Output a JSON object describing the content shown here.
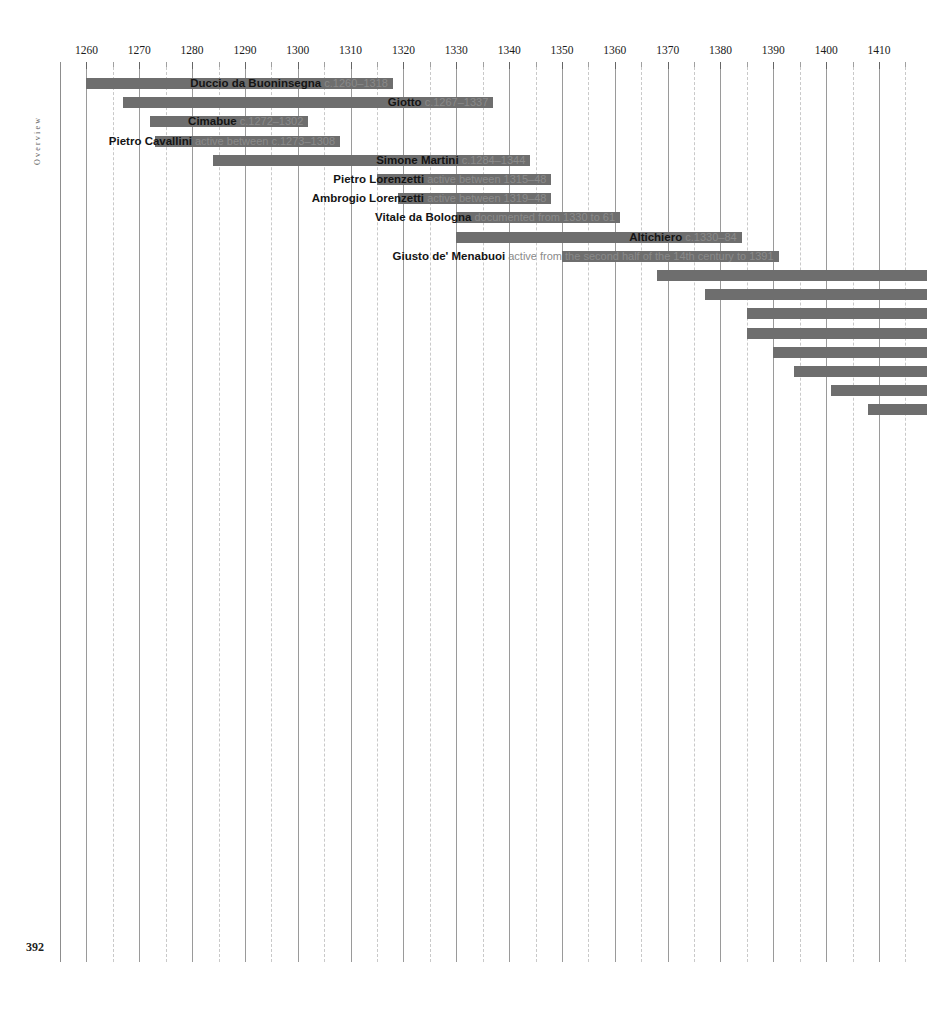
{
  "page": {
    "folio": "392",
    "section_label": "Overview"
  },
  "chart_data": {
    "type": "bar",
    "orientation": "horizontal",
    "title": "",
    "subtitle": "",
    "xlabel": "",
    "ylabel": "",
    "grid": true,
    "legend_position": "none",
    "xlim": [
      1255,
      1417
    ],
    "axis": {
      "major_step": 10,
      "minor_step": 5,
      "tick_labels": [
        "1260",
        "1270",
        "1280",
        "1290",
        "1300",
        "1310",
        "1320",
        "1330",
        "1340",
        "1350",
        "1360",
        "1370",
        "1380",
        "1390",
        "1400",
        "1410"
      ],
      "tick_values": [
        1260,
        1270,
        1280,
        1290,
        1300,
        1310,
        1320,
        1330,
        1340,
        1350,
        1360,
        1370,
        1380,
        1390,
        1400,
        1410
      ],
      "minor_tick_values": [
        1265,
        1275,
        1285,
        1295,
        1305,
        1315,
        1325,
        1335,
        1345,
        1355,
        1365,
        1375,
        1385,
        1395,
        1405,
        1415
      ]
    },
    "bar_color": "#6e6e6e",
    "categories": [
      "Duccio da Buoninsegna",
      "Giotto",
      "Cimabue",
      "Pietro Cavallini",
      "Simone Martini",
      "Pietro Lorenzetti",
      "Ambrogio Lorenzetti",
      "Vitale da Bologna",
      "Altichiero",
      "Giusto de' Menabuoi"
    ],
    "series": [
      {
        "name": "lifespan-or-activity-range",
        "values": [
          {
            "name": "Duccio da Buoninsegna",
            "dates": "c.1260–1318",
            "start": 1260,
            "end": 1318
          },
          {
            "name": "Giotto",
            "dates": "c.1267–1337",
            "start": 1267,
            "end": 1337
          },
          {
            "name": "Cimabue",
            "dates": "c.1272–1302",
            "start": 1272,
            "end": 1302
          },
          {
            "name": "Pietro Cavallini",
            "dates": "active between c.1273–1308",
            "start": 1273,
            "end": 1308
          },
          {
            "name": "Simone Martini",
            "dates": "c.1284–1344",
            "start": 1284,
            "end": 1344
          },
          {
            "name": "Pietro Lorenzetti",
            "dates": "active between 1315–48",
            "start": 1315,
            "end": 1348
          },
          {
            "name": "Ambrogio Lorenzetti",
            "dates": "active between 1319–48",
            "start": 1319,
            "end": 1348
          },
          {
            "name": "Vitale da Bologna",
            "dates": "documented from 1330 to 61",
            "start": 1330,
            "end": 1361
          },
          {
            "name": "Altichiero",
            "dates": "c.1330–84",
            "start": 1330,
            "end": 1384
          },
          {
            "name": "Giusto de' Menabuoi",
            "dates": "active from the second half of the 14th century to 1391",
            "start": 1350,
            "end": 1391
          }
        ]
      }
    ],
    "overflow_bars": [
      {
        "start": 1368,
        "end": 1419
      },
      {
        "start": 1377,
        "end": 1419
      },
      {
        "start": 1385,
        "end": 1419
      },
      {
        "start": 1385,
        "end": 1419
      },
      {
        "start": 1390,
        "end": 1419
      },
      {
        "start": 1394,
        "end": 1419
      },
      {
        "start": 1401,
        "end": 1419
      },
      {
        "start": 1408,
        "end": 1419
      }
    ]
  }
}
